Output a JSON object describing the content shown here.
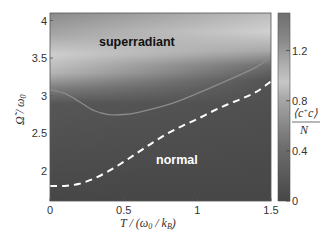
{
  "chart_data": {
    "type": "heatmap",
    "title": "",
    "xlabel": "T / (ω0 / kB)",
    "ylabel": "Ω̃ / ω0",
    "colorbar_label": "⟨c†c⟩ / N",
    "xlim": [
      0,
      1.5
    ],
    "ylim": [
      1.6,
      4.1
    ],
    "clim": [
      0,
      1.5
    ],
    "x_ticks": [
      0,
      0.5,
      1,
      1.5
    ],
    "x_tick_labels": [
      "0",
      "0.5",
      "1",
      "1.5"
    ],
    "y_ticks": [
      2,
      2.5,
      3,
      3.5,
      4
    ],
    "y_tick_labels": [
      "2",
      "2.5",
      "3",
      "3.5",
      "4"
    ],
    "colorbar_ticks": [
      0,
      0.4,
      0.8,
      1.2
    ],
    "colorbar_tick_labels": [
      "0",
      "0.4",
      "0.8",
      "1.2"
    ],
    "colormap": "gray-diverging (dark at 0, light near 0.9, mid-gray at 1.5)",
    "annotations": [
      {
        "text": "superradiant",
        "x": 0.62,
        "y": 3.72,
        "color": "#111111"
      },
      {
        "text": "normal",
        "x": 0.96,
        "y": 2.24,
        "color": "#ffffff"
      }
    ],
    "series": [
      {
        "name": "solid phase boundary",
        "style": "solid",
        "color": "#8c8c8c",
        "x": [
          0,
          0.1,
          0.2,
          0.3,
          0.4,
          0.5,
          0.6,
          0.8,
          1.0,
          1.2,
          1.4,
          1.5
        ],
        "y": [
          3.08,
          3.03,
          2.92,
          2.8,
          2.75,
          2.75,
          2.78,
          2.88,
          3.03,
          3.2,
          3.38,
          3.52
        ]
      },
      {
        "name": "dashed mean-field boundary",
        "style": "dashed",
        "color": "#ffffff",
        "x": [
          0,
          0.1,
          0.2,
          0.3,
          0.4,
          0.5,
          0.6,
          0.7,
          0.8,
          0.9,
          1.0,
          1.1,
          1.2,
          1.3,
          1.4,
          1.5
        ],
        "y": [
          1.8,
          1.8,
          1.83,
          1.9,
          2.0,
          2.12,
          2.25,
          2.38,
          2.5,
          2.6,
          2.69,
          2.79,
          2.88,
          2.96,
          3.05,
          3.19
        ]
      }
    ],
    "grid": false,
    "legend": null
  }
}
